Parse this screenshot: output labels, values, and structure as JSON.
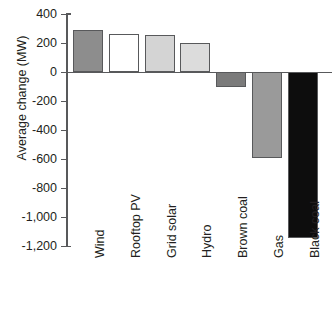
{
  "chart_data": {
    "type": "bar",
    "title": "",
    "subtitle": "",
    "xlabel": "",
    "ylabel": "Average change (MW)",
    "categories": [
      "Wind",
      "Rooftop PV",
      "Grid solar",
      "Hydro",
      "Brown coal",
      "Gas",
      "Black coal"
    ],
    "values": [
      290,
      260,
      258,
      200,
      -100,
      -590,
      -1145
    ],
    "bar_colors": [
      "#8d8d8d",
      "#ffffff",
      "#d4d4d4",
      "#dcdcdc",
      "#7b7b7b",
      "#9a9a9a",
      "#0d0d0d"
    ],
    "bar_edge_color": "#58595b",
    "ylim": [
      -1200,
      400
    ],
    "yticks": [
      400,
      200,
      0,
      -200,
      -400,
      -600,
      -800,
      -1000,
      -1200
    ],
    "ytick_labels": [
      "400",
      "200",
      "0",
      "-200",
      "-400",
      "-600",
      "-800",
      "-1,000",
      "-1,200"
    ],
    "grid": false,
    "legend": false,
    "legend_position": "none",
    "axis_color": "#58595b",
    "background_color": "#ffffff"
  }
}
